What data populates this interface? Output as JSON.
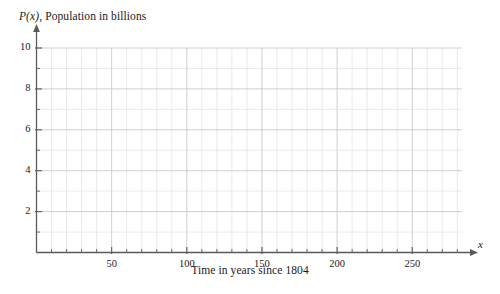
{
  "chart_data": {
    "type": "line",
    "title": "",
    "subtitle": "",
    "xlabel": "Time in years since 1804",
    "ylabel": "P(x), Population in billions",
    "ylabel_function": "P(x)",
    "ylabel_rest": ", Population in billions",
    "x_axis_variable": "x",
    "xlim": [
      0,
      290
    ],
    "ylim": [
      0,
      10.6
    ],
    "x_major_ticks": [
      50,
      100,
      150,
      200,
      250
    ],
    "x_major_tick_labels": [
      "50",
      "100",
      "150",
      "200",
      "250"
    ],
    "x_minor_tick_step": 10,
    "y_major_ticks": [
      2,
      4,
      6,
      8,
      10
    ],
    "y_major_tick_labels": [
      "2",
      "4",
      "6",
      "8",
      "10"
    ],
    "y_minor_tick_step": 1,
    "grid": true,
    "grid_x_step": 10,
    "grid_y_step": 1,
    "legend": "none",
    "series": [],
    "values": [],
    "categories": [],
    "annotations": [],
    "note": "Empty coordinate grid with no plotted data"
  },
  "colors": {
    "background": "#ffffff",
    "axis": "#5a5a5a",
    "grid_minor": "#dcdcdc",
    "grid_major": "#c9c9c9",
    "text": "#1a1a1a"
  }
}
